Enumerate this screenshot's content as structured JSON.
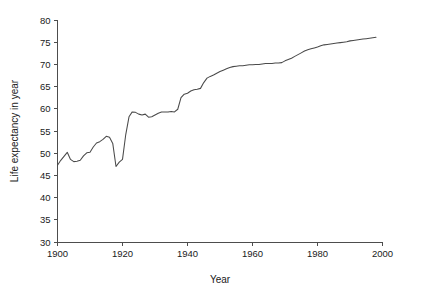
{
  "chart_data": {
    "type": "line",
    "title": "",
    "xlabel": "Year",
    "ylabel": "Life expectancy in year",
    "xlim": [
      1900,
      2000
    ],
    "ylim": [
      30,
      80
    ],
    "grid": false,
    "legend_position": "none",
    "x_ticks": [
      "1900",
      "1920",
      "1940",
      "1960",
      "1980",
      "2000"
    ],
    "x_tick_values": [
      1900,
      1920,
      1940,
      1960,
      1980,
      2000
    ],
    "y_ticks": [
      "30",
      "35",
      "40",
      "45",
      "50",
      "55",
      "60",
      "65",
      "70",
      "75",
      "80"
    ],
    "y_tick_values": [
      30,
      35,
      40,
      45,
      50,
      55,
      60,
      65,
      70,
      75,
      80
    ],
    "line_color": "#4a4a4a",
    "series": [
      {
        "name": "Life expectancy",
        "x": [
          1900,
          1901,
          1902,
          1903,
          1904,
          1905,
          1906,
          1907,
          1908,
          1909,
          1910,
          1911,
          1912,
          1913,
          1914,
          1915,
          1916,
          1917,
          1918,
          1919,
          1920,
          1921,
          1922,
          1923,
          1924,
          1925,
          1926,
          1927,
          1928,
          1929,
          1930,
          1931,
          1932,
          1933,
          1934,
          1935,
          1936,
          1937,
          1938,
          1939,
          1940,
          1941,
          1942,
          1943,
          1944,
          1945,
          1946,
          1947,
          1948,
          1949,
          1950,
          1951,
          1952,
          1953,
          1954,
          1955,
          1956,
          1957,
          1958,
          1959,
          1960,
          1961,
          1962,
          1963,
          1964,
          1965,
          1966,
          1967,
          1968,
          1969,
          1970,
          1971,
          1972,
          1973,
          1974,
          1975,
          1976,
          1977,
          1978,
          1979,
          1980,
          1981,
          1982,
          1983,
          1984,
          1985,
          1986,
          1987,
          1988,
          1989,
          1990,
          1991,
          1992,
          1993,
          1994,
          1995,
          1996,
          1997,
          1998
        ],
        "values": [
          47.3,
          48.4,
          49.3,
          50.2,
          48.6,
          48.1,
          48.2,
          48.4,
          49.4,
          50.1,
          50.2,
          51.4,
          52.3,
          52.6,
          53.1,
          53.8,
          53.6,
          52.2,
          47.0,
          48.0,
          48.6,
          54.2,
          58.2,
          59.3,
          59.2,
          58.8,
          58.6,
          58.8,
          58.1,
          58.2,
          58.6,
          59.0,
          59.3,
          59.3,
          59.3,
          59.4,
          59.3,
          59.9,
          62.5,
          63.3,
          63.5,
          64.0,
          64.3,
          64.4,
          64.6,
          65.9,
          66.9,
          67.3,
          67.6,
          68.0,
          68.4,
          68.7,
          69.0,
          69.3,
          69.5,
          69.6,
          69.7,
          69.7,
          69.8,
          69.9,
          69.9,
          70.0,
          70.0,
          70.1,
          70.2,
          70.2,
          70.2,
          70.3,
          70.3,
          70.4,
          70.8,
          71.1,
          71.4,
          71.8,
          72.2,
          72.6,
          73.0,
          73.3,
          73.5,
          73.7,
          73.9,
          74.2,
          74.4,
          74.5,
          74.6,
          74.7,
          74.8,
          74.9,
          75.0,
          75.1,
          75.3,
          75.4,
          75.5,
          75.6,
          75.7,
          75.8,
          75.9,
          76.0,
          76.1
        ]
      }
    ]
  }
}
